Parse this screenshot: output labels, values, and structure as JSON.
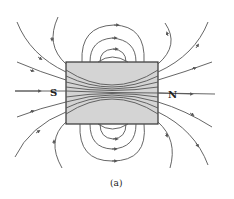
{
  "figure": {
    "caption": "(a)",
    "magnet": {
      "south_label": "S",
      "north_label": "N",
      "fill": "#d4d4d4",
      "stroke": "#333333"
    },
    "line_color": "#555555",
    "arrow_color": "#555555"
  }
}
